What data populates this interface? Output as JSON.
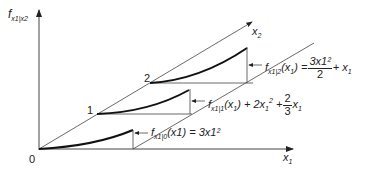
{
  "diagram": {
    "axes": {
      "y_label": "f",
      "y_label_sub": "x1|x2",
      "x1_label": "x",
      "x1_sub": "1",
      "x2_label": "x",
      "x2_sub": "2",
      "origin_label": "0"
    },
    "level_labels": [
      "1",
      "2"
    ],
    "curves": [
      {
        "name": "f_x1|0",
        "lhs": "f",
        "lhs_sub": "x1|0",
        "arg": "(x1) = 3x1²",
        "text": "f_{x1|0}(x1) = 3x1^2"
      },
      {
        "name": "f_x1|1",
        "lhs": "f",
        "lhs_sub": "x1|1",
        "text": "f_{x1|1}(x1) + 2x1^2 + (2/3)x1",
        "frac_num": "2",
        "frac_den": "3"
      },
      {
        "name": "f_x1|2",
        "lhs": "f",
        "lhs_sub": "x1|2",
        "text": "f_{x1|2}(x1) = 3x1^2/2 + x1",
        "frac_num": "3x1²",
        "frac_den": "2"
      }
    ]
  }
}
